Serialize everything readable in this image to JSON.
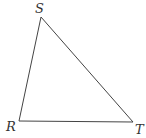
{
  "diagram": {
    "type": "triangle",
    "vertices": [
      {
        "label": "S",
        "x": 41,
        "y": 17,
        "label_x": 35,
        "label_y": 13
      },
      {
        "label": "R",
        "x": 19,
        "y": 121,
        "label_x": 6,
        "label_y": 131
      },
      {
        "label": "T",
        "x": 133,
        "y": 122,
        "label_x": 135,
        "label_y": 134
      }
    ],
    "edges": [
      [
        "S",
        "R"
      ],
      [
        "R",
        "T"
      ],
      [
        "T",
        "S"
      ]
    ],
    "colors": {
      "stroke": "#444444",
      "label": "#333333",
      "background": "#ffffff"
    }
  }
}
